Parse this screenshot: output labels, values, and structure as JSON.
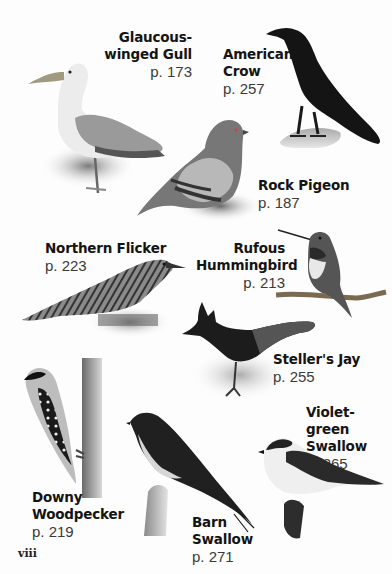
{
  "page": {
    "folio": "viii",
    "birds": [
      {
        "name_line1": "Glaucous-",
        "name_line2": "winged Gull",
        "page": "p. 173",
        "icon": "gull-illustration"
      },
      {
        "name_line1": "American",
        "name_line2": "Crow",
        "page": "p. 257",
        "icon": "crow-illustration"
      },
      {
        "name_line1": "Rock Pigeon",
        "name_line2": "",
        "page": "p. 187",
        "icon": "pigeon-illustration"
      },
      {
        "name_line1": "Northern Flicker",
        "name_line2": "",
        "page": "p. 223",
        "icon": "flicker-illustration"
      },
      {
        "name_line1": "Rufous",
        "name_line2": "Hummingbird",
        "page": "p. 213",
        "icon": "hummingbird-illustration"
      },
      {
        "name_line1": "Steller's Jay",
        "name_line2": "",
        "page": "p. 255",
        "icon": "jay-illustration"
      },
      {
        "name_line1": "Violet-green",
        "name_line2": "Swallow",
        "page": "p. 265",
        "icon": "violet-green-swallow-illustration"
      },
      {
        "name_line1": "Downy",
        "name_line2": "Woodpecker",
        "page": "p. 219",
        "icon": "woodpecker-illustration"
      },
      {
        "name_line1": "Barn",
        "name_line2": "Swallow",
        "page": "p. 271",
        "icon": "barn-swallow-illustration"
      }
    ]
  }
}
